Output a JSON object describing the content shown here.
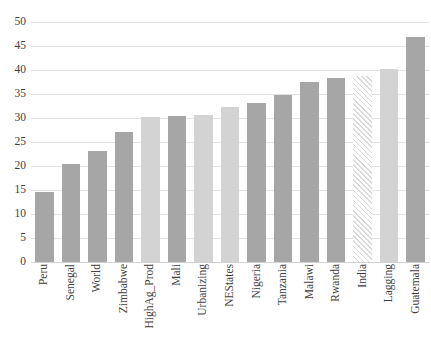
{
  "chart_data": {
    "type": "bar",
    "title": "",
    "subtitle": "",
    "xlabel": "",
    "ylabel": "",
    "ylim": [
      0,
      50
    ],
    "ytick_step": 5,
    "grid": true,
    "legend": "none",
    "orientation": "vertical",
    "xtick_rotation": -90,
    "categories": [
      "Peru",
      "Senegal",
      "World",
      "Zimbabwe",
      "HighAg_Prod",
      "Mali",
      "Urbanizing",
      "NEStates",
      "Nigeria",
      "Tanzania",
      "Malawi",
      "Rwanda",
      "India",
      "Lagging",
      "Guatemala"
    ],
    "values": [
      14.5,
      20.5,
      23.2,
      27.0,
      30.3,
      30.5,
      30.6,
      32.2,
      33.2,
      34.7,
      37.5,
      38.4,
      38.8,
      40.2,
      46.8
    ],
    "bar_styles": [
      "dark",
      "dark",
      "dark",
      "dark",
      "light",
      "dark",
      "light",
      "light",
      "dark",
      "dark",
      "dark",
      "dark",
      "hatch",
      "light",
      "dark"
    ],
    "ytick_labels": [
      "0",
      "5",
      "10",
      "15",
      "20",
      "25",
      "30",
      "35",
      "40",
      "45",
      "50"
    ],
    "ytick_values": [
      0,
      5,
      10,
      15,
      20,
      25,
      30,
      35,
      40,
      45,
      50
    ],
    "colors": {
      "bar_dark": "#a6a6a6",
      "bar_light": "#d3d3d3",
      "bar_hatch": "#d9d9d9",
      "gridline": "#e2e2e2",
      "text": "#3f3f3f",
      "background": "#ffffff"
    }
  }
}
